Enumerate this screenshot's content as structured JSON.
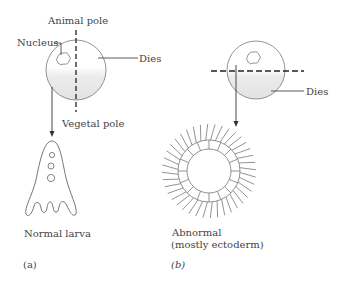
{
  "panel_a": {
    "label": "(a)",
    "labels": {
      "animal_pole": "Animal pole",
      "nucleus": "Nucleus",
      "dies": "Dies",
      "vegetal_pole": "Vegetal pole",
      "result": "Normal larva"
    },
    "cut": "vertical (meridional) through animal and vegetal poles"
  },
  "panel_b": {
    "label": "(b)",
    "labels": {
      "dies": "Dies",
      "result_line1": "Abnormal",
      "result_line2": "(mostly ectoderm)"
    },
    "cut": "horizontal (equatorial)"
  },
  "colors": {
    "line": "#555555",
    "vegetal_shading": "#e6e6e6",
    "background": "#ffffff"
  }
}
